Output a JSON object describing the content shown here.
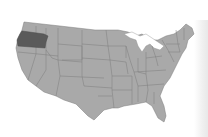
{
  "map": {
    "region": "United States (contiguous)",
    "highlighted_state": "Oregon",
    "colors": {
      "state_fill": "#a9a9a9",
      "state_border": "#7d7d7d",
      "highlight_fill": "#5a5a5a",
      "background": "#ffffff"
    }
  }
}
